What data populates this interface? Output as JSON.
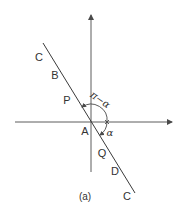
{
  "figure": {
    "caption": "(a)",
    "colors": {
      "line": "#4a4a4a",
      "text": "#333333",
      "background": "#ffffff"
    },
    "axes": {
      "vertical": {
        "x": 91,
        "y_from": 172,
        "y_to": 15,
        "arrow": "up"
      },
      "horizontal": {
        "y": 122,
        "x_from": 15,
        "x_to": 172,
        "arrow": "right"
      }
    },
    "slanted_line": {
      "x1": 43,
      "y1": 43,
      "x2": 135,
      "y2": 193
    },
    "origin_label": "A",
    "points": [
      {
        "label": "C",
        "x": 39,
        "y": 57
      },
      {
        "label": "B",
        "x": 55,
        "y": 75
      },
      {
        "label": "P",
        "x": 67,
        "y": 100
      },
      {
        "label": "A",
        "x": 85,
        "y": 131
      },
      {
        "label": "Q",
        "x": 102,
        "y": 153
      },
      {
        "label": "D",
        "x": 115,
        "y": 171
      },
      {
        "label": "C",
        "x": 127,
        "y": 196
      }
    ],
    "angles": {
      "large": {
        "label": "π−α",
        "x": 100,
        "y": 100
      },
      "small": {
        "label": "α",
        "x": 110,
        "y": 133
      }
    }
  }
}
